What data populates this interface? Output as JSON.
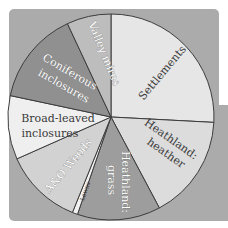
{
  "chart_data": {
    "type": "pie",
    "title": "",
    "slices": [
      {
        "label": "Settlements",
        "start_deg": 0,
        "end_deg": 93,
        "percent": 25.8,
        "color": "#e6e6e6"
      },
      {
        "label": "Heathland: heather",
        "start_deg": 93,
        "end_deg": 152,
        "percent": 16.4,
        "color": "#dcdcdc"
      },
      {
        "label": "Heathland: grass",
        "start_deg": 152,
        "end_deg": 199,
        "percent": 13.1,
        "color": "#9d9d9d"
      },
      {
        "label": "Lawns",
        "start_deg": 199,
        "end_deg": 202,
        "percent": 0.8,
        "color": "#f2f2f2"
      },
      {
        "label": "A&O Woods",
        "start_deg": 202,
        "end_deg": 246,
        "percent": 12.2,
        "color": "#d2d2d2"
      },
      {
        "label": "Broad-leaved inclosures",
        "start_deg": 246,
        "end_deg": 282,
        "percent": 10.0,
        "color": "#efefef"
      },
      {
        "label": "Coniferous inclosures",
        "start_deg": 282,
        "end_deg": 335,
        "percent": 14.7,
        "color": "#909090"
      },
      {
        "label": "Valley mires",
        "start_deg": 335,
        "end_deg": 360,
        "percent": 6.9,
        "color": "#bdbdbd"
      }
    ],
    "legend": "none",
    "center": [
      111,
      117
    ],
    "radius": 103
  },
  "labels": {
    "settlements": "Settlements",
    "heathland_heather_1": "Heathland:",
    "heathland_heather_2": "heather",
    "heathland_grass_1": "Heathland:",
    "heathland_grass_2": "grass",
    "lawns": "Lawns",
    "ao_woods": "A&O Woods",
    "broad_leaved_1": "Broad-leaved",
    "broad_leaved_2": "inclosures",
    "coniferous_1": "Coniferous",
    "coniferous_2": "inclosures",
    "valley_mires": "Valley mires"
  }
}
